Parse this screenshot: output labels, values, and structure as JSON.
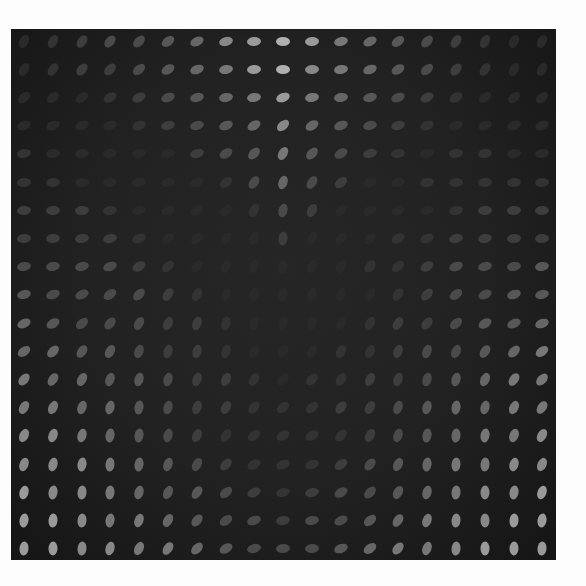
{
  "artwork": {
    "title": "",
    "background_color": "#1f1f1f",
    "page_color": "#fdfdfd",
    "grid": {
      "rows": 19,
      "cols": 19,
      "x0": 13,
      "y0": 12,
      "dx": 28.8,
      "dy": 28.2,
      "dot_w": 14,
      "dot_h": 9
    },
    "brightness": [
      [
        0,
        1,
        2,
        3,
        3,
        4,
        5,
        7,
        8,
        9,
        8,
        6,
        5,
        4,
        3,
        2,
        1,
        0,
        0
      ],
      [
        0,
        1,
        2,
        2,
        3,
        4,
        5,
        6,
        8,
        9,
        7,
        6,
        5,
        4,
        3,
        2,
        1,
        0,
        0
      ],
      [
        0,
        0,
        0,
        1,
        2,
        3,
        4,
        5,
        6,
        8,
        6,
        5,
        4,
        3,
        2,
        1,
        0,
        0,
        0
      ],
      [
        0,
        0,
        0,
        0,
        1,
        2,
        3,
        4,
        5,
        7,
        5,
        4,
        3,
        2,
        1,
        0,
        0,
        0,
        0
      ],
      [
        1,
        0,
        0,
        0,
        0,
        0,
        2,
        3,
        4,
        6,
        4,
        3,
        2,
        1,
        0,
        1,
        1,
        0,
        0
      ],
      [
        1,
        1,
        0,
        0,
        0,
        0,
        0,
        1,
        3,
        5,
        3,
        2,
        0,
        0,
        1,
        1,
        1,
        1,
        1
      ],
      [
        2,
        2,
        2,
        1,
        0,
        0,
        0,
        0,
        1,
        3,
        2,
        0,
        0,
        0,
        0,
        1,
        2,
        2,
        2
      ],
      [
        2,
        2,
        2,
        2,
        1,
        0,
        0,
        0,
        0,
        2,
        0,
        0,
        0,
        1,
        1,
        2,
        2,
        2,
        2
      ],
      [
        3,
        3,
        3,
        3,
        2,
        1,
        0,
        0,
        0,
        0,
        0,
        0,
        1,
        1,
        2,
        3,
        3,
        3,
        4
      ],
      [
        4,
        3,
        3,
        3,
        3,
        2,
        1,
        0,
        0,
        0,
        0,
        0,
        0,
        1,
        2,
        3,
        3,
        4,
        4
      ],
      [
        5,
        4,
        3,
        3,
        3,
        2,
        2,
        1,
        0,
        0,
        0,
        0,
        1,
        2,
        2,
        3,
        4,
        4,
        5
      ],
      [
        5,
        5,
        4,
        4,
        3,
        2,
        2,
        1,
        0,
        0,
        0,
        1,
        1,
        2,
        3,
        3,
        4,
        5,
        6
      ],
      [
        6,
        5,
        5,
        4,
        4,
        3,
        2,
        2,
        1,
        0,
        1,
        1,
        2,
        2,
        3,
        4,
        5,
        6,
        6
      ],
      [
        6,
        6,
        5,
        5,
        4,
        3,
        2,
        2,
        1,
        1,
        1,
        2,
        2,
        3,
        4,
        5,
        5,
        6,
        6
      ],
      [
        7,
        7,
        6,
        5,
        4,
        3,
        2,
        1,
        1,
        1,
        1,
        1,
        2,
        3,
        4,
        5,
        6,
        6,
        7
      ],
      [
        7,
        7,
        7,
        6,
        5,
        4,
        3,
        2,
        1,
        1,
        1,
        2,
        3,
        4,
        5,
        6,
        6,
        7,
        7
      ],
      [
        8,
        7,
        7,
        6,
        5,
        4,
        4,
        3,
        2,
        1,
        2,
        3,
        3,
        4,
        5,
        6,
        7,
        7,
        8
      ],
      [
        8,
        8,
        7,
        6,
        6,
        5,
        4,
        3,
        3,
        2,
        3,
        3,
        4,
        5,
        6,
        7,
        7,
        8,
        8
      ],
      [
        8,
        8,
        7,
        7,
        6,
        6,
        5,
        4,
        3,
        3,
        3,
        4,
        5,
        6,
        6,
        7,
        8,
        8,
        8
      ]
    ],
    "angles": [
      [
        -60,
        -60,
        -55,
        -50,
        -45,
        -35,
        -25,
        -15,
        -5,
        0,
        -5,
        -15,
        -25,
        -35,
        -45,
        -55,
        -60,
        -60,
        -60
      ],
      [
        -60,
        -55,
        -50,
        -45,
        -40,
        -30,
        -20,
        -10,
        -5,
        0,
        -5,
        -10,
        -20,
        -30,
        -40,
        -50,
        -55,
        -60,
        -60
      ],
      [
        -40,
        -40,
        -35,
        -30,
        -25,
        -20,
        -15,
        -10,
        -10,
        -20,
        -10,
        -10,
        -15,
        -20,
        -25,
        -30,
        -35,
        -40,
        -40
      ],
      [
        -20,
        -20,
        -20,
        -20,
        -20,
        -15,
        -15,
        -20,
        -30,
        -40,
        -30,
        -20,
        -15,
        -15,
        -20,
        -20,
        -20,
        -20,
        -20
      ],
      [
        -10,
        -10,
        -10,
        -10,
        -10,
        -10,
        -15,
        -30,
        -45,
        -60,
        -45,
        -30,
        -15,
        -10,
        -10,
        -10,
        -10,
        -10,
        -10
      ],
      [
        -5,
        -5,
        -5,
        -5,
        -10,
        -15,
        -20,
        -40,
        -55,
        -70,
        -55,
        -40,
        -20,
        -15,
        -10,
        -5,
        -5,
        -5,
        -5
      ],
      [
        -5,
        -5,
        -5,
        -10,
        -15,
        -20,
        -30,
        -45,
        -60,
        -75,
        -60,
        -45,
        -30,
        -20,
        -15,
        -10,
        -5,
        -5,
        -5
      ],
      [
        -5,
        -5,
        -10,
        -15,
        -20,
        -30,
        -40,
        -50,
        -65,
        -80,
        -65,
        -50,
        -40,
        -30,
        -20,
        -15,
        -10,
        -5,
        -5
      ],
      [
        -10,
        -10,
        -15,
        -20,
        -30,
        -40,
        -50,
        -60,
        -70,
        -80,
        -70,
        -60,
        -50,
        -40,
        -30,
        -20,
        -15,
        -10,
        -10
      ],
      [
        -15,
        -20,
        -25,
        -35,
        -45,
        -55,
        -60,
        -70,
        -75,
        -80,
        -75,
        -70,
        -60,
        -55,
        -45,
        -35,
        -25,
        -20,
        -15
      ],
      [
        -25,
        -30,
        -40,
        -50,
        -60,
        -65,
        -70,
        -75,
        -75,
        -75,
        -70,
        -65,
        -60,
        -55,
        -50,
        -40,
        -30,
        -25,
        -20
      ],
      [
        -35,
        -45,
        -55,
        -60,
        -70,
        -75,
        -75,
        -70,
        -60,
        -55,
        -55,
        -60,
        -65,
        -70,
        -70,
        -65,
        -55,
        -45,
        -35
      ],
      [
        -50,
        -55,
        -60,
        -70,
        -75,
        -75,
        -70,
        -65,
        -55,
        -45,
        -45,
        -55,
        -65,
        -70,
        -75,
        -75,
        -65,
        -55,
        -45
      ],
      [
        -60,
        -65,
        -70,
        -75,
        -80,
        -75,
        -70,
        -60,
        -50,
        -40,
        -40,
        -50,
        -60,
        -70,
        -75,
        -80,
        -75,
        -65,
        -55
      ],
      [
        -65,
        -70,
        -75,
        -80,
        -80,
        -75,
        -65,
        -55,
        -40,
        -30,
        -30,
        -45,
        -60,
        -70,
        -80,
        -85,
        -80,
        -70,
        -60
      ],
      [
        -70,
        -75,
        -80,
        -85,
        -80,
        -70,
        -60,
        -45,
        -30,
        -20,
        -20,
        -35,
        -50,
        -65,
        -80,
        -85,
        -85,
        -75,
        -65
      ],
      [
        -75,
        -80,
        -85,
        -85,
        -75,
        -65,
        -55,
        -40,
        -25,
        -15,
        -15,
        -30,
        -45,
        -60,
        -75,
        -85,
        -88,
        -80,
        -70
      ],
      [
        -80,
        -85,
        -85,
        -80,
        -70,
        -60,
        -50,
        -35,
        -20,
        -10,
        -10,
        -25,
        -40,
        -55,
        -70,
        -85,
        -90,
        -85,
        -80
      ],
      [
        -85,
        -88,
        -85,
        -75,
        -65,
        -55,
        -45,
        -30,
        -15,
        -5,
        -5,
        -20,
        -35,
        -50,
        -70,
        -85,
        -90,
        -88,
        -85
      ]
    ],
    "levels": [
      "#2a2a2a",
      "#333333",
      "#3d3d3d",
      "#4a4a4a",
      "#575757",
      "#666666",
      "#777777",
      "#888888",
      "#9a9a9a",
      "#b0b0b0"
    ]
  }
}
